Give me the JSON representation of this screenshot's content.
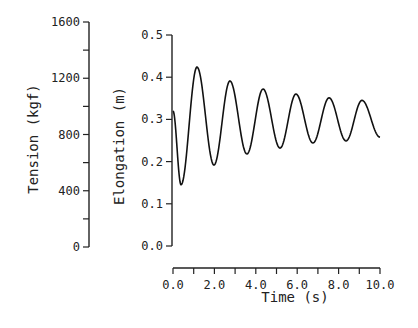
{
  "chart_data": {
    "type": "line",
    "title": "",
    "xlabel": "Time (s)",
    "ylabel": "Elongation (m)",
    "secondary_ylabel": "Tension (kgf)",
    "xlim": [
      0,
      10
    ],
    "ylim": [
      0,
      0.5
    ],
    "secondary_ylim": [
      0,
      1600
    ],
    "x_ticks": [
      0,
      1,
      2,
      3,
      4,
      5,
      6,
      7,
      8,
      9,
      10
    ],
    "x_tick_labels": [
      "0.0",
      "2.0",
      "4.0",
      "6.0",
      "8.0",
      "10.0"
    ],
    "x_tick_label_values": [
      0,
      2,
      4,
      6,
      8,
      10
    ],
    "y_ticks": [
      0,
      0.1,
      0.2,
      0.3,
      0.4,
      0.5
    ],
    "y_tick_labels": [
      "0.0",
      "0.1",
      "0.2",
      "0.3",
      "0.4",
      "0.5"
    ],
    "secondary_y_ticks": [
      0,
      200,
      400,
      600,
      800,
      1000,
      1200,
      1400,
      1600
    ],
    "secondary_y_tick_labels": [
      "0",
      "400",
      "800",
      "1200",
      "1600"
    ],
    "secondary_y_tick_label_values": [
      0,
      400,
      800,
      1200,
      1600
    ],
    "grid": false,
    "legend": null,
    "series": [
      {
        "name": "Elongation",
        "axis": "right",
        "note": "damped oscillation; points are extrema",
        "x": [
          0.0,
          0.39,
          1.16,
          1.98,
          2.75,
          3.57,
          4.35,
          5.17,
          5.94,
          6.76,
          7.54,
          8.36,
          9.13,
          10.0
        ],
        "y": [
          0.32,
          0.145,
          0.424,
          0.192,
          0.391,
          0.218,
          0.372,
          0.232,
          0.36,
          0.244,
          0.351,
          0.249,
          0.345,
          0.258
        ]
      }
    ]
  }
}
